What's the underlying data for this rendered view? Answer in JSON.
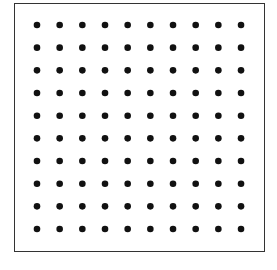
{
  "diagram": {
    "type": "dot-grid",
    "rows": 10,
    "columns": 10,
    "total_dots": 100,
    "dot_color": "#111111",
    "frame_color": "#333333",
    "background": "#ffffff",
    "first_dot": {
      "x": 37,
      "y": 25
    },
    "spacing": 22.67,
    "dot_radius": 3.3
  }
}
